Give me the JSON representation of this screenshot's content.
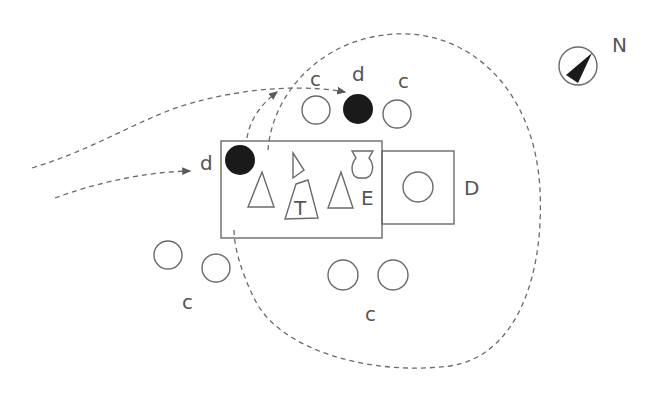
{
  "diagram": {
    "type": "site-plan",
    "colors": {
      "line": "#6a6a6a",
      "text": "#555555",
      "fill_dark": "#1a1a1a",
      "background": "#ffffff"
    },
    "labels": {
      "north": "N",
      "c_top_left": "c",
      "d_top": "d",
      "c_top_right": "c",
      "d_left": "d",
      "T": "T",
      "E": "E",
      "D": "D",
      "c_bottom_left": "c",
      "c_bottom_right": "c"
    },
    "elements": {
      "compass": {
        "name": "north-arrow-compass",
        "cx": 578,
        "cy": 66,
        "r": 19
      },
      "main_hall": {
        "name": "main-hall-rectangle",
        "x": 221,
        "y": 141,
        "w": 161,
        "h": 97
      },
      "annex_D": {
        "name": "annex-d-square",
        "x": 382,
        "y": 151,
        "w": 72,
        "h": 73
      },
      "circles_open": [
        {
          "cx": 316,
          "cy": 110,
          "r": 14
        },
        {
          "cx": 397,
          "cy": 114,
          "r": 14
        },
        {
          "cx": 418,
          "cy": 187,
          "r": 15
        },
        {
          "cx": 168,
          "cy": 255,
          "r": 14
        },
        {
          "cx": 216,
          "cy": 268,
          "r": 14
        },
        {
          "cx": 343,
          "cy": 275,
          "r": 15
        },
        {
          "cx": 393,
          "cy": 275,
          "r": 15
        }
      ],
      "circles_filled": [
        {
          "cx": 358,
          "cy": 109,
          "r": 15
        },
        {
          "cx": 240,
          "cy": 160,
          "r": 15
        }
      ]
    }
  }
}
